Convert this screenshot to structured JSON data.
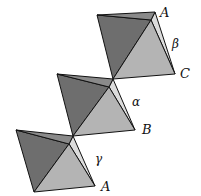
{
  "figure": {
    "colors": {
      "background": "#ffffff",
      "dark_face": "#6e6e6e",
      "light_face": "#b4b4b4",
      "edge_sliver": "#dcdcdc",
      "stroke": "#111111"
    },
    "octahedra": [
      {
        "id": "top",
        "points": {
          "tl": [
            97,
            15
          ],
          "tr": [
            155,
            12
          ],
          "br": [
            175,
            74
          ],
          "bl": [
            113,
            79
          ],
          "apex": [
            152,
            22
          ]
        }
      },
      {
        "id": "middle",
        "points": {
          "tl": [
            57,
            74
          ],
          "tr": [
            113,
            79
          ],
          "br": [
            135,
            130
          ],
          "bl": [
            73,
            136
          ],
          "apex": [
            113,
            79
          ]
        }
      },
      {
        "id": "bottom",
        "points": {
          "tl": [
            16,
            130
          ],
          "tr": [
            73,
            136
          ],
          "br": [
            95,
            186
          ],
          "bl": [
            34,
            192
          ],
          "apex": [
            73,
            136
          ]
        }
      }
    ],
    "vertex_labels": [
      {
        "text": "A",
        "x": 160,
        "y": 17
      },
      {
        "text": "C",
        "x": 180,
        "y": 78
      },
      {
        "text": "B",
        "x": 142,
        "y": 134
      },
      {
        "text": "A",
        "x": 101,
        "y": 191
      }
    ],
    "angle_labels": [
      {
        "text": "β",
        "x": 172,
        "y": 48
      },
      {
        "text": "α",
        "x": 132,
        "y": 106
      },
      {
        "text": "γ",
        "x": 95,
        "y": 163
      }
    ]
  }
}
